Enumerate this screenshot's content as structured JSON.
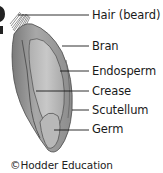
{
  "diagram": {
    "labels": [
      {
        "id": "hair",
        "text": "Hair (beard)",
        "y": 16,
        "line_x1": 18
      },
      {
        "id": "bran",
        "text": "Bran",
        "y": 46,
        "line_x1": 62
      },
      {
        "id": "endosperm",
        "text": "Endosperm",
        "y": 71,
        "line_x1": 60
      },
      {
        "id": "crease",
        "text": "Crease",
        "y": 91,
        "line_x1": 36
      },
      {
        "id": "scutellum",
        "text": "Scutellum",
        "y": 110,
        "line_x1": 72
      },
      {
        "id": "germ",
        "text": "Germ",
        "y": 129,
        "line_x1": 54
      }
    ],
    "credit": "©Hodder Education",
    "colors": {
      "grain_outer": "#8a8a8a",
      "grain_mid": "#a9a9a9",
      "grain_inner": "#c4c4c4",
      "grain_outline": "#4a4a4a",
      "leader_line": "#1a1a1a",
      "text": "#1a1a1a"
    }
  }
}
